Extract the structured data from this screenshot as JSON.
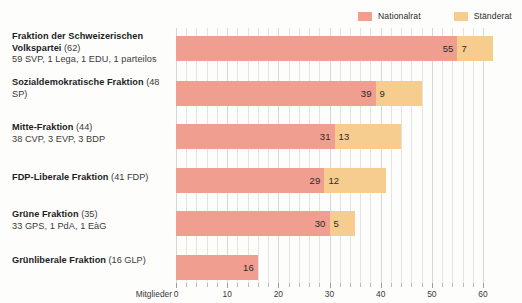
{
  "legend": {
    "items": [
      {
        "label": "Nationalrat",
        "color": "#ef9e90",
        "key": "nationalrat"
      },
      {
        "label": "Ständerat",
        "color": "#f7cd8f",
        "key": "staenderat"
      }
    ]
  },
  "axis": {
    "title": "Mitglieder",
    "ticks": [
      0,
      10,
      20,
      30,
      40,
      50,
      60
    ],
    "tick_labels": [
      "0",
      "10",
      "20",
      "30",
      "40",
      "50",
      "60"
    ],
    "min": 0,
    "max": 60,
    "minor_step": 2
  },
  "rows": [
    {
      "name": "Fraktion der Schweizerischen Volkspartei",
      "paren": "(62)",
      "sub": "59 SVP, 1 Lega, 1 EDU, 1 parteilos",
      "nationalrat": 55,
      "staenderat": 7,
      "nationalrat_label": "55",
      "staenderat_label": "7"
    },
    {
      "name": "Sozialdemokratische Fraktion",
      "paren": "(48 SP)",
      "sub": "",
      "nationalrat": 39,
      "staenderat": 9,
      "nationalrat_label": "39",
      "staenderat_label": "9"
    },
    {
      "name": "Mitte-Fraktion",
      "paren": "(44)",
      "sub": "38 CVP, 3 EVP, 3 BDP",
      "nationalrat": 31,
      "staenderat": 13,
      "nationalrat_label": "31",
      "staenderat_label": "13"
    },
    {
      "name": "FDP-Liberale Fraktion",
      "paren": "(41 FDP)",
      "sub": "",
      "nationalrat": 29,
      "staenderat": 12,
      "nationalrat_label": "29",
      "staenderat_label": "12"
    },
    {
      "name": "Grüne Fraktion",
      "paren": "(35)",
      "sub": "33 GPS, 1 PdA, 1 EàG",
      "nationalrat": 30,
      "staenderat": 5,
      "nationalrat_label": "30",
      "staenderat_label": "5"
    },
    {
      "name": "Grünliberale Fraktion",
      "paren": "(16 GLP)",
      "sub": "",
      "nationalrat": 16,
      "staenderat": 0,
      "nationalrat_label": "16",
      "staenderat_label": ""
    }
  ],
  "chart_data": {
    "type": "bar",
    "orientation": "horizontal",
    "stacked": true,
    "title": "",
    "xlabel": "Mitglieder",
    "ylabel": "",
    "xlim": [
      0,
      60
    ],
    "grid": true,
    "legend_position": "top-right",
    "categories": [
      "Fraktion der Schweizerischen Volkspartei (62)",
      "Sozialdemokratische Fraktion (48 SP)",
      "Mitte-Fraktion (44)",
      "FDP-Liberale Fraktion (41 FDP)",
      "Grüne Fraktion (35)",
      "Grünliberale Fraktion (16 GLP)"
    ],
    "series": [
      {
        "name": "Nationalrat",
        "color": "#ef9e90",
        "values": [
          55,
          39,
          31,
          29,
          30,
          16
        ]
      },
      {
        "name": "Ständerat",
        "color": "#f7cd8f",
        "values": [
          7,
          9,
          13,
          12,
          5,
          0
        ]
      }
    ],
    "totals": [
      62,
      48,
      44,
      41,
      35,
      16
    ]
  }
}
